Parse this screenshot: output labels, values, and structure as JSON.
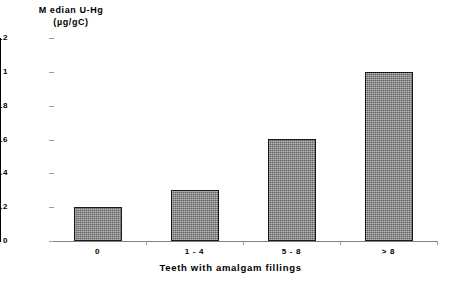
{
  "chart_data": {
    "type": "bar",
    "title": "",
    "categories": [
      "0",
      "1 - 4",
      "5 - 8",
      "> 8"
    ],
    "values": [
      0.2,
      0.3,
      0.6,
      1.0
    ],
    "series": [
      {
        "name": "Median U-Hg",
        "values": [
          0.2,
          0.3,
          0.6,
          1.0
        ]
      }
    ],
    "xlabel": "Teeth with amalgam fillings",
    "ylabel_line1": "M edian U-Hg",
    "ylabel_line2": "(µg/gC)",
    "ylabel": "Median U-Hg (µg/gC)",
    "ylim": [
      0,
      1.2
    ],
    "ytick_labels": [
      "1.2",
      "1",
      "0.8",
      "0.6",
      "0.4",
      "0.2",
      "0"
    ],
    "ytick_values": [
      1.2,
      1,
      0.8,
      0.6,
      0.4,
      0.2,
      0
    ],
    "grid": false,
    "legend": "none",
    "bar_color": "#8d8d8d",
    "bar_border_color": "#1a1a1a",
    "axis_color": "#000000",
    "background_color": "#ffffff"
  }
}
